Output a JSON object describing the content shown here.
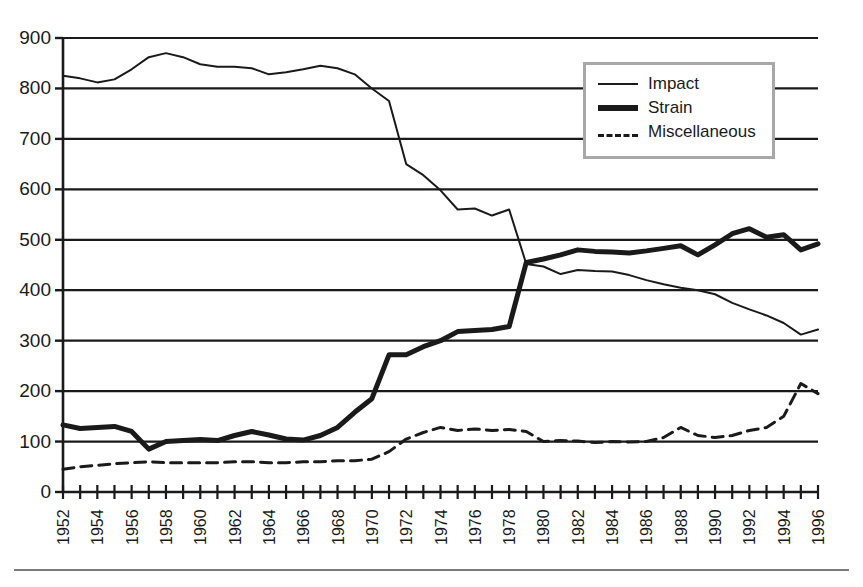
{
  "chart_data": {
    "type": "line",
    "title": "",
    "subtitle": "",
    "xlabel": "",
    "ylabel": "",
    "xlim": [
      1952,
      1996
    ],
    "ylim": [
      0,
      900
    ],
    "grid": true,
    "grid_axis": "y",
    "legend_position": "top-right",
    "y_ticks": [
      0,
      100,
      200,
      300,
      400,
      500,
      600,
      700,
      800,
      900
    ],
    "y_tick_labels": [
      "0",
      "100",
      "200",
      "300",
      "400",
      "500",
      "600",
      "700",
      "800",
      "900"
    ],
    "x_ticks": [
      1952,
      1953,
      1954,
      1955,
      1956,
      1957,
      1958,
      1959,
      1960,
      1961,
      1962,
      1963,
      1964,
      1965,
      1966,
      1967,
      1968,
      1969,
      1970,
      1971,
      1972,
      1973,
      1974,
      1975,
      1976,
      1977,
      1978,
      1979,
      1980,
      1981,
      1982,
      1983,
      1984,
      1985,
      1986,
      1987,
      1988,
      1989,
      1990,
      1991,
      1992,
      1993,
      1994,
      1995,
      1996
    ],
    "x_tick_labels": [
      "1952",
      "1954",
      "1956",
      "1958",
      "1960",
      "1962",
      "1964",
      "1966",
      "1968",
      "1970",
      "1972",
      "1974",
      "1976",
      "1978",
      "1980",
      "1982",
      "1984",
      "1986",
      "1988",
      "1990",
      "1992",
      "1994",
      "1996"
    ],
    "x_tick_label_years": [
      1952,
      1954,
      1956,
      1958,
      1960,
      1962,
      1964,
      1966,
      1968,
      1970,
      1972,
      1974,
      1976,
      1978,
      1980,
      1982,
      1984,
      1986,
      1988,
      1990,
      1992,
      1994,
      1996
    ],
    "x_tick_label_rotation": -90,
    "x": [
      1952,
      1953,
      1954,
      1955,
      1956,
      1957,
      1958,
      1959,
      1960,
      1961,
      1962,
      1963,
      1964,
      1965,
      1966,
      1967,
      1968,
      1969,
      1970,
      1971,
      1972,
      1973,
      1974,
      1975,
      1976,
      1977,
      1978,
      1979,
      1980,
      1981,
      1982,
      1983,
      1984,
      1985,
      1986,
      1987,
      1988,
      1989,
      1990,
      1991,
      1992,
      1993,
      1994,
      1995,
      1996
    ],
    "series": [
      {
        "name": "Impact",
        "style": "solid-thin",
        "color": "#1a1a1a",
        "line_width": 2,
        "values": [
          825,
          820,
          812,
          818,
          838,
          862,
          870,
          862,
          848,
          843,
          843,
          840,
          828,
          832,
          838,
          845,
          840,
          828,
          800,
          775,
          650,
          628,
          598,
          560,
          562,
          548,
          560,
          452,
          447,
          432,
          440,
          438,
          437,
          430,
          420,
          412,
          405,
          400,
          392,
          375,
          362,
          350,
          335,
          312,
          322
        ]
      },
      {
        "name": "Strain",
        "style": "solid-thick",
        "color": "#1a1a1a",
        "line_width": 5,
        "values": [
          133,
          126,
          128,
          130,
          120,
          85,
          100,
          102,
          104,
          102,
          112,
          120,
          113,
          105,
          103,
          112,
          128,
          158,
          185,
          272,
          272,
          288,
          300,
          318,
          320,
          322,
          328,
          455,
          462,
          470,
          480,
          477,
          476,
          474,
          478,
          483,
          488,
          470,
          490,
          512,
          522,
          505,
          510,
          480,
          492
        ]
      },
      {
        "name": "Miscellaneous",
        "style": "dashed",
        "color": "#1a1a1a",
        "line_width": 3,
        "values": [
          45,
          50,
          53,
          56,
          58,
          60,
          58,
          58,
          58,
          58,
          60,
          60,
          58,
          58,
          60,
          60,
          62,
          62,
          65,
          80,
          105,
          118,
          128,
          122,
          125,
          122,
          124,
          120,
          100,
          102,
          101,
          98,
          100,
          99,
          100,
          108,
          128,
          112,
          108,
          112,
          122,
          128,
          150,
          215,
          195
        ]
      }
    ]
  },
  "legend": {
    "entries": [
      {
        "label": "Impact",
        "style": "solid-thin"
      },
      {
        "label": "Strain",
        "style": "solid-thick"
      },
      {
        "label": "Miscellaneous",
        "style": "dashed"
      }
    ]
  },
  "colors": {
    "ink": "#1a1a1a",
    "legend_border": "#a8a8a8",
    "rule": "#7a7a7a",
    "background": "#ffffff"
  }
}
